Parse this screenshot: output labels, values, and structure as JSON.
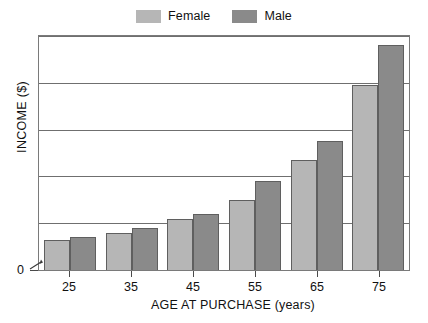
{
  "legend": {
    "position": "top-center",
    "entries": [
      {
        "label": "Female",
        "color": "#b6b6b6"
      },
      {
        "label": "Male",
        "color": "#8a8a8a"
      }
    ]
  },
  "axes": {
    "y_title": "INCOME ($)",
    "y_zero_label": "0",
    "x_title": "AGE AT PURCHASE (years)"
  },
  "chart_data": {
    "type": "bar",
    "title": "",
    "subtitle": "",
    "xlabel": "AGE AT PURCHASE (years)",
    "ylabel": "INCOME ($)",
    "categories": [
      "25",
      "35",
      "45",
      "55",
      "65",
      "75"
    ],
    "series": [
      {
        "name": "Female",
        "color": "#b6b6b6",
        "values": [
          13,
          16,
          22,
          30,
          47,
          79
        ]
      },
      {
        "name": "Male",
        "color": "#8a8a8a",
        "values": [
          14,
          18,
          24,
          38,
          55,
          96
        ]
      }
    ],
    "ylim": [
      0,
      100
    ],
    "y_tick_labels": [
      "0"
    ],
    "gridlines": {
      "horizontal": true,
      "count": 5,
      "positions_pct": [
        0,
        20,
        40,
        60,
        80
      ]
    },
    "grid": true,
    "legend_position": "top-center",
    "axis_break": true,
    "annotations": [
      "y-axis break arrow near 0"
    ]
  }
}
